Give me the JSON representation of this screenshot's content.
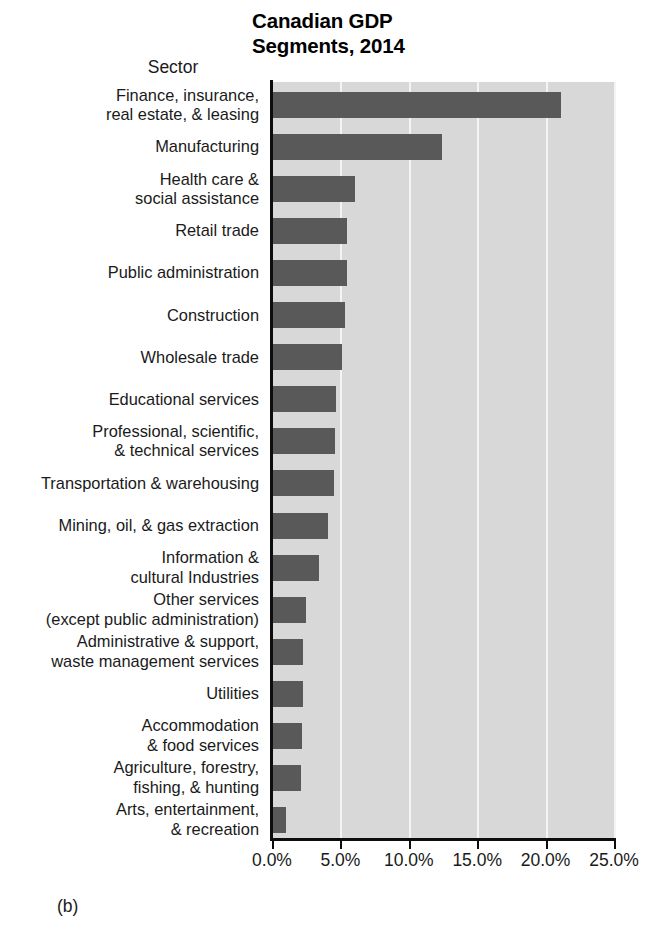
{
  "figure": {
    "panel_label": "(b)",
    "title": "Canadian GDP\nSegments, 2014"
  },
  "axes": {
    "y_axis_title": "Sector",
    "x_tick_labels": [
      "0.0%",
      "5.0%",
      "10.0%",
      "15.0%",
      "20.0%",
      "25.0%"
    ]
  },
  "colors": {
    "bar": "#595959",
    "plot_background": "#d8d8d8",
    "gridline": "#f4f4f4",
    "axis_line": "#0d0d0d",
    "text": "#1a1a1a"
  },
  "chart_data": {
    "type": "bar",
    "orientation": "horizontal",
    "title": "Canadian GDP Segments, 2014",
    "xlabel": "",
    "ylabel": "Sector",
    "xlim": [
      0,
      25
    ],
    "xticks": [
      0,
      5,
      10,
      15,
      20,
      25
    ],
    "xtick_labels": [
      "0.0%",
      "5.0%",
      "10.0%",
      "15.0%",
      "20.0%",
      "25.0%"
    ],
    "grid": true,
    "grid_axis": "x",
    "legend": false,
    "units": "percent",
    "categories": [
      "Finance, insurance,\nreal estate, & leasing",
      "Manufacturing",
      "Health care &\nsocial assistance",
      "Retail trade",
      "Public administration",
      "Construction",
      "Wholesale trade",
      "Educational services",
      "Professional, scientific,\n& technical services",
      "Transportation & warehousing",
      "Mining, oil, & gas extraction",
      "Information &\ncultural Industries",
      "Other services\n(except public administration)",
      "Administrative & support,\nwaste management services",
      "Utilities",
      "Accommodation\n& food services",
      "Agriculture, forestry,\nfishing, & hunting",
      "Arts, entertainment,\n& recreation"
    ],
    "values": [
      21.1,
      12.4,
      6.1,
      5.5,
      5.5,
      5.3,
      5.1,
      4.7,
      4.6,
      4.5,
      4.1,
      3.4,
      2.5,
      2.3,
      2.3,
      2.2,
      2.1,
      1.0
    ]
  }
}
